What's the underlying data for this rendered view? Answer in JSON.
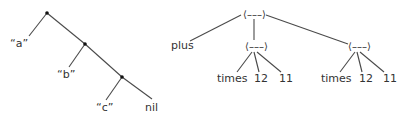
{
  "left_tree": {
    "description": "cons-cell list tree",
    "nodes": [
      {
        "id": "n1",
        "type": "dot"
      },
      {
        "id": "n2",
        "type": "dot"
      },
      {
        "id": "n3",
        "type": "dot"
      }
    ],
    "leaves": [
      {
        "id": "leaf-a",
        "label": "“a”",
        "parent": "n1"
      },
      {
        "id": "leaf-b",
        "label": "“b”",
        "parent": "n2"
      },
      {
        "id": "leaf-c",
        "label": "“c”",
        "parent": "n3"
      },
      {
        "id": "leaf-nil",
        "label": "nil",
        "parent": "n3"
      }
    ],
    "edges": [
      [
        "n1",
        "leaf-a"
      ],
      [
        "n1",
        "n2"
      ],
      [
        "n2",
        "leaf-b"
      ],
      [
        "n2",
        "n3"
      ],
      [
        "n3",
        "leaf-c"
      ],
      [
        "n3",
        "leaf-nil"
      ]
    ]
  },
  "right_tree": {
    "description": "expression tree",
    "node_glyph": "⟨–––⟩",
    "nodes": [
      {
        "id": "r0",
        "label": "⟨–––⟩"
      },
      {
        "id": "r1",
        "label": "⟨–––⟩"
      },
      {
        "id": "r2",
        "label": "⟨–––⟩"
      }
    ],
    "leaves": [
      {
        "id": "plus",
        "label": "plus",
        "parent": "r0"
      },
      {
        "id": "times1",
        "label": "times",
        "parent": "r1"
      },
      {
        "id": "n12a",
        "label": "12",
        "parent": "r1"
      },
      {
        "id": "n11a",
        "label": "11",
        "parent": "r1"
      },
      {
        "id": "times2",
        "label": "times",
        "parent": "r2"
      },
      {
        "id": "n12b",
        "label": "12",
        "parent": "r2"
      },
      {
        "id": "n11b",
        "label": "11",
        "parent": "r2"
      }
    ],
    "edges": [
      [
        "r0",
        "plus"
      ],
      [
        "r0",
        "r1"
      ],
      [
        "r0",
        "r2"
      ],
      [
        "r1",
        "times1"
      ],
      [
        "r1",
        "n12a"
      ],
      [
        "r1",
        "n11a"
      ],
      [
        "r2",
        "times2"
      ],
      [
        "r2",
        "n12b"
      ],
      [
        "r2",
        "n11b"
      ]
    ]
  },
  "colors": {
    "line": "#4a4a4a",
    "text": "#333333",
    "dot": "#111111"
  }
}
